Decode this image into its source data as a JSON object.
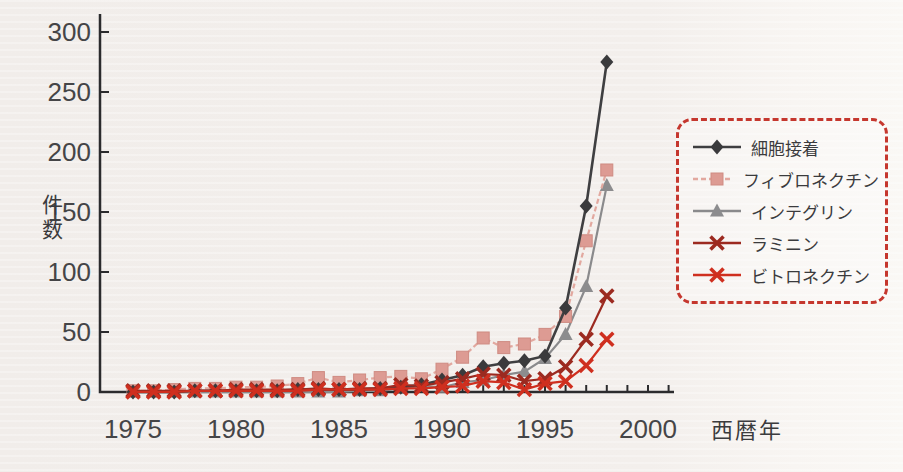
{
  "figure": {
    "y_axis_title": "件数",
    "x_axis_title": "西暦年"
  },
  "colors": {
    "background": "#f2eeeb",
    "axis": "#2b2b2d",
    "tick_label": "#454547",
    "legend_border": "#c5372e",
    "legend_text": "#3b3b3d"
  },
  "chart_data": {
    "type": "line",
    "title": "",
    "xlabel": "西暦年",
    "ylabel": "件数",
    "grid": false,
    "legend_position": "right",
    "legend_border_style": "red-dashed-rounded",
    "xlim": [
      1974,
      2001.5
    ],
    "ylim": [
      0,
      310
    ],
    "x_tick_labels": [
      1975,
      1980,
      1985,
      1990,
      1995,
      2000
    ],
    "x_minor_tick_years": [
      1975,
      2001
    ],
    "y_ticks": [
      0,
      50,
      100,
      150,
      200,
      250,
      300
    ],
    "x": [
      1975,
      1976,
      1977,
      1978,
      1979,
      1980,
      1981,
      1982,
      1983,
      1984,
      1985,
      1986,
      1987,
      1988,
      1989,
      1990,
      1991,
      1992,
      1993,
      1994,
      1995,
      1996,
      1997,
      1998
    ],
    "series": [
      {
        "id": "cell-adhesion",
        "name": "細胞接着",
        "marker": "diamond",
        "color": "#3a3a3c",
        "line_color": "#3f3f41",
        "line_style": "solid",
        "values": [
          0,
          0,
          0,
          1,
          1,
          1,
          1,
          1,
          2,
          2,
          2,
          2,
          3,
          4,
          6,
          10,
          14,
          21,
          24,
          26,
          30,
          70,
          155,
          275
        ]
      },
      {
        "id": "fibronectin",
        "name": "フィブロネクチン",
        "marker": "square",
        "color": "#dd9b93",
        "line_color": "#e2a89f",
        "line_style": "dashed",
        "values": [
          1,
          1,
          2,
          3,
          3,
          4,
          4,
          5,
          7,
          12,
          8,
          10,
          12,
          13,
          11,
          19,
          29,
          45,
          37,
          40,
          48,
          63,
          126,
          185
        ]
      },
      {
        "id": "integrin",
        "name": "インテグリン",
        "marker": "triangle",
        "color": "#8c8c8e",
        "line_color": "#8a8a8c",
        "line_style": "solid",
        "values": [
          0,
          0,
          0,
          0,
          0,
          0,
          0,
          0,
          0,
          0,
          0,
          1,
          1,
          3,
          5,
          4,
          8,
          10,
          14,
          17,
          28,
          48,
          88,
          172
        ]
      },
      {
        "id": "laminin",
        "name": "ラミニン",
        "marker": "x",
        "color": "#9c2a20",
        "line_color": "#9c2a20",
        "line_style": "solid",
        "values": [
          1,
          1,
          1,
          1,
          1,
          2,
          2,
          2,
          2,
          3,
          2,
          3,
          3,
          6,
          5,
          8,
          11,
          15,
          14,
          9,
          11,
          21,
          44,
          80
        ]
      },
      {
        "id": "vitronectin",
        "name": "ビトロネクチン",
        "marker": "x",
        "color": "#cf2f1f",
        "line_color": "#cf2f1f",
        "line_style": "solid",
        "values": [
          0,
          0,
          0,
          1,
          1,
          1,
          1,
          1,
          1,
          2,
          2,
          2,
          2,
          3,
          3,
          4,
          5,
          9,
          8,
          2,
          7,
          9,
          22,
          44
        ]
      }
    ]
  }
}
